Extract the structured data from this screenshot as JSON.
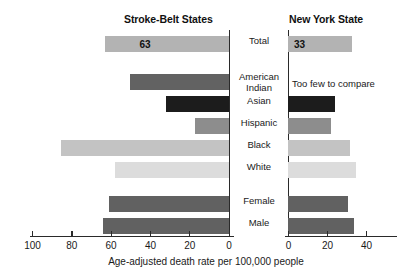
{
  "chart_data": {
    "type": "bar",
    "title": "",
    "xlabel": "Age-adjusted death rate per 100,000 people",
    "ylabel": "",
    "orientation": "horizontal",
    "panels": [
      {
        "name": "Stroke-Belt States",
        "direction": "left",
        "axis_ticks": [
          100,
          80,
          60,
          40,
          20,
          0
        ],
        "xlim": [
          100,
          0
        ]
      },
      {
        "name": "New York State",
        "direction": "right",
        "axis_ticks": [
          0,
          20,
          40
        ],
        "xlim": [
          0,
          48
        ]
      }
    ],
    "categories": [
      "Total",
      "American Indian",
      "Asian",
      "Hispanic",
      "Black",
      "White",
      "Female",
      "Male"
    ],
    "series": [
      {
        "name": "Stroke-Belt States",
        "values": [
          63,
          50,
          32,
          17,
          85,
          58,
          61,
          64
        ]
      },
      {
        "name": "New York State",
        "values": [
          33,
          null,
          24,
          22,
          32,
          35,
          31,
          34
        ]
      }
    ],
    "data_labels": {
      "stroke_belt_total": "63",
      "new_york_total": "33"
    },
    "annotations": [
      {
        "text": "Too few to compare",
        "category": "American Indian",
        "panel": "New York State"
      }
    ],
    "grid": false,
    "legend": "none"
  },
  "titles": {
    "left_panel": "Stroke-Belt States",
    "right_panel": "New York State"
  },
  "categories": [
    {
      "label": "Total"
    },
    {
      "label": "American\nIndian"
    },
    {
      "label": "Asian"
    },
    {
      "label": "Hispanic"
    },
    {
      "label": "Black"
    },
    {
      "label": "White"
    },
    {
      "label": "Female"
    },
    {
      "label": "Male"
    }
  ],
  "bars_left": [
    {
      "label": "Total",
      "value": 63,
      "color": "#b3b3b3",
      "value_text": "63"
    },
    {
      "label": "American Indian",
      "value": 50,
      "color": "#626262",
      "value_text": ""
    },
    {
      "label": "Asian",
      "value": 32,
      "color": "#1c1c1c",
      "value_text": ""
    },
    {
      "label": "Hispanic",
      "value": 17,
      "color": "#8d8d8d",
      "value_text": ""
    },
    {
      "label": "Black",
      "value": 85,
      "color": "#c3c3c3",
      "value_text": ""
    },
    {
      "label": "White",
      "value": 58,
      "color": "#dcdcdc",
      "value_text": ""
    },
    {
      "label": "Female",
      "value": 61,
      "color": "#616161",
      "value_text": ""
    },
    {
      "label": "Male",
      "value": 64,
      "color": "#616161",
      "value_text": ""
    }
  ],
  "bars_right": [
    {
      "label": "Total",
      "value": 33,
      "color": "#b3b3b3",
      "value_text": "33"
    },
    {
      "label": "American Indian",
      "value": 0,
      "color": "transparent",
      "value_text": ""
    },
    {
      "label": "Asian",
      "value": 24,
      "color": "#1c1c1c",
      "value_text": ""
    },
    {
      "label": "Hispanic",
      "value": 22,
      "color": "#8d8d8d",
      "value_text": ""
    },
    {
      "label": "Black",
      "value": 32,
      "color": "#c3c3c3",
      "value_text": ""
    },
    {
      "label": "White",
      "value": 35,
      "color": "#dcdcdc",
      "value_text": ""
    },
    {
      "label": "Female",
      "value": 31,
      "color": "#616161",
      "value_text": ""
    },
    {
      "label": "Male",
      "value": 34,
      "color": "#616161",
      "value_text": ""
    }
  ],
  "axis_left": {
    "ticks": [
      "100",
      "80",
      "60",
      "40",
      "20",
      "0"
    ]
  },
  "axis_right": {
    "ticks": [
      "0",
      "20",
      "40"
    ]
  },
  "note": {
    "too_few": "Too few to compare"
  },
  "caption": {
    "x_axis": "Age-adjusted death rate per 100,000 people"
  },
  "colors": {
    "background": "#ffffff",
    "axis": "#2a2a2a",
    "text": "#1a1a1a"
  }
}
